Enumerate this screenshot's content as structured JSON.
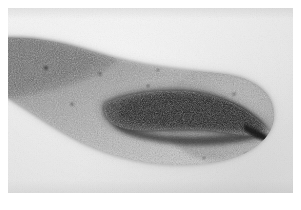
{
  "figure": {
    "kind": "photomicrograph",
    "caption": "",
    "label": "",
    "scalebar": "",
    "annotations": []
  },
  "plate": {
    "background_color": "#e9e9e9",
    "paper_margin_color": "#ffffff",
    "margin_px": 8,
    "width_px": 285,
    "height_px": 185
  },
  "specimen": {
    "name": "specimen-body",
    "body_fill_light": "#cfcfcf",
    "body_fill_mid": "#9a9a9a",
    "body_fill_dark": "#6d6d6d",
    "core_color": "#1a1a1a",
    "core_name": "dark-internal-structure",
    "outline_color": "#8a8a8a",
    "orientation": "tapering to lower-left, rounded at right",
    "texture": "granular stained speckle"
  },
  "palette": {
    "white": "#ffffff",
    "light_gray": "#e9e9e9",
    "mid_gray": "#9a9a9a",
    "dark_gray": "#4a4a4a",
    "near_black": "#1a1a1a"
  }
}
